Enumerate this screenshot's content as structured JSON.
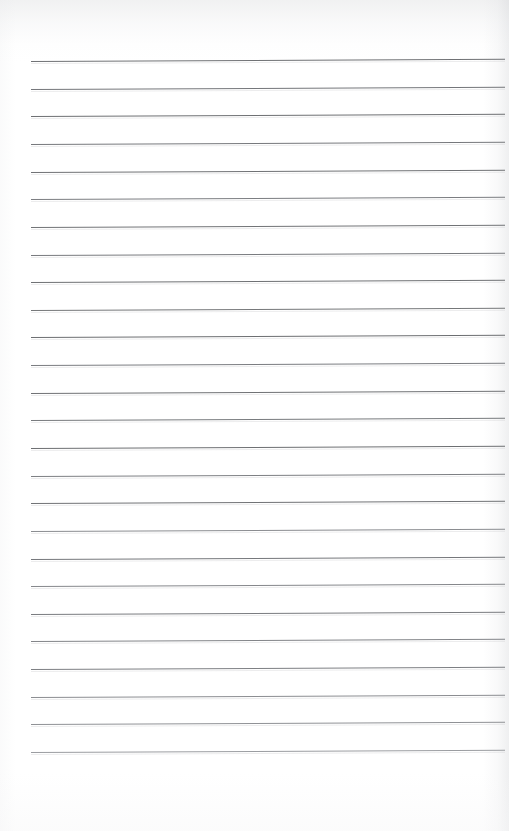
{
  "page": {
    "kind": "scanned-lined-notebook-page",
    "width_px": 509,
    "height_px": 831,
    "background_color": "#ffffff",
    "content_text": "",
    "has_handwriting": false,
    "has_margin_line": false,
    "orientation": "portrait"
  },
  "ruling": {
    "line_count": 26,
    "first_line_y": 61,
    "last_line_y": 752,
    "line_spacing_px": 27.64,
    "line_left_x": 31,
    "line_right_x": 505,
    "line_length_px": 474,
    "line_thickness_px": 1,
    "line_color": "#7f8184",
    "line_color_light": "#9c9ea2",
    "line_color_dark": "#6b6d70",
    "tilt_deg": -0.28,
    "top_margin_px": 61,
    "bottom_margin_px": 79,
    "left_margin_px": 31,
    "right_margin_px": 4,
    "lines": [
      {
        "index": 1,
        "y": 61.0,
        "shade": "#6f7174"
      },
      {
        "index": 2,
        "y": 88.6,
        "shade": "#74767a"
      },
      {
        "index": 3,
        "y": 116.3,
        "shade": "#6d6f72"
      },
      {
        "index": 4,
        "y": 143.9,
        "shade": "#76787c"
      },
      {
        "index": 5,
        "y": 171.6,
        "shade": "#6f7174"
      },
      {
        "index": 6,
        "y": 199.2,
        "shade": "#7b7d81"
      },
      {
        "index": 7,
        "y": 226.8,
        "shade": "#717376"
      },
      {
        "index": 8,
        "y": 254.5,
        "shade": "#787a7e"
      },
      {
        "index": 9,
        "y": 282.1,
        "shade": "#6e7073"
      },
      {
        "index": 10,
        "y": 309.8,
        "shade": "#757779"
      },
      {
        "index": 11,
        "y": 337.4,
        "shade": "#6c6e71"
      },
      {
        "index": 12,
        "y": 365.0,
        "shade": "#7a7c80"
      },
      {
        "index": 13,
        "y": 392.7,
        "shade": "#6f7174"
      },
      {
        "index": 14,
        "y": 420.3,
        "shade": "#777a7d"
      },
      {
        "index": 15,
        "y": 448.0,
        "shade": "#6d6f72"
      },
      {
        "index": 16,
        "y": 475.6,
        "shade": "#7d7f83"
      },
      {
        "index": 17,
        "y": 503.2,
        "shade": "#707275"
      },
      {
        "index": 18,
        "y": 530.9,
        "shade": "#8a8c90"
      },
      {
        "index": 19,
        "y": 558.5,
        "shade": "#75777b"
      },
      {
        "index": 20,
        "y": 586.2,
        "shade": "#85878b"
      },
      {
        "index": 21,
        "y": 613.8,
        "shade": "#797b7f"
      },
      {
        "index": 22,
        "y": 641.4,
        "shade": "#828488"
      },
      {
        "index": 23,
        "y": 669.1,
        "shade": "#7d7f83"
      },
      {
        "index": 24,
        "y": 696.7,
        "shade": "#8b8d91"
      },
      {
        "index": 25,
        "y": 724.4,
        "shade": "#8f9195"
      },
      {
        "index": 26,
        "y": 752.0,
        "shade": "#9a9ca0"
      }
    ]
  }
}
